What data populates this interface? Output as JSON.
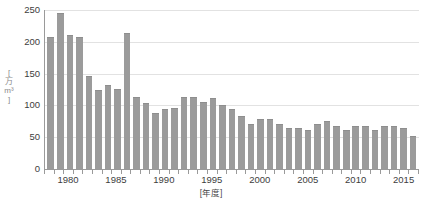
{
  "chart_data": {
    "type": "bar",
    "title": "",
    "xlabel": "[年度]",
    "ylabel": "[万m³]",
    "ylabel_chars": "[\n万\nm³\n]",
    "ylim": [
      0,
      250
    ],
    "yticks": [
      250,
      200,
      150,
      100,
      50,
      0
    ],
    "xticks_labeled": [
      "1980",
      "1985",
      "1990",
      "1995",
      "2000",
      "2005",
      "2010",
      "2015"
    ],
    "grid": true,
    "legend": "none",
    "bar_color": "#9b9b9b",
    "axis_color": "#9a9a9a",
    "gridline_color": "#e2e2e2",
    "categories": [
      "1978",
      "1979",
      "1980",
      "1981",
      "1982",
      "1983",
      "1984",
      "1985",
      "1986",
      "1987",
      "1988",
      "1989",
      "1990",
      "1991",
      "1992",
      "1993",
      "1994",
      "1995",
      "1996",
      "1997",
      "1998",
      "1999",
      "2000",
      "2001",
      "2002",
      "2003",
      "2004",
      "2005",
      "2006",
      "2007",
      "2008",
      "2009",
      "2010",
      "2011",
      "2012",
      "2013",
      "2014",
      "2015",
      "2016"
    ],
    "values": [
      207,
      245,
      210,
      207,
      146,
      125,
      132,
      126,
      214,
      114,
      104,
      88,
      94,
      96,
      114,
      114,
      105,
      112,
      101,
      94,
      84,
      71,
      79,
      78,
      70,
      64,
      65,
      62,
      71,
      76,
      68,
      62,
      67,
      67,
      61,
      67,
      67,
      64,
      52
    ],
    "value_unit": "万m³"
  },
  "source": {
    "note": ""
  }
}
